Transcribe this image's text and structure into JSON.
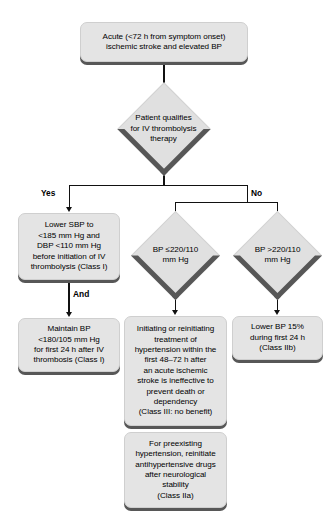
{
  "diagram": {
    "type": "flowchart",
    "colors": {
      "node_fill": "#e4e4e4",
      "diamond_fill": "#e0e0e0",
      "shadow": "#575757",
      "connector": "#111111",
      "background": "#ffffff"
    },
    "nodes": {
      "start": {
        "shape": "process",
        "text": "Acute (<72 h from symptom onset)\nischemic stroke and elevated BP"
      },
      "decision_thrombolysis": {
        "shape": "decision",
        "text": "Patient qualifies\nfor IV thrombolysis\ntherapy"
      },
      "lower_sbp": {
        "shape": "process",
        "text": "Lower SBP to\n<185 mm Hg and\nDBP <110 mm Hg\nbefore initiation of IV\nthrombolysis (Class I)"
      },
      "maintain_bp": {
        "shape": "process",
        "text": "Maintain BP\n<180/105 mm Hg\nfor first 24 h after IV\nthrombosis (Class I)"
      },
      "decision_bp_le": {
        "shape": "decision",
        "text": "BP ≤220/110\nmm Hg"
      },
      "decision_bp_gt": {
        "shape": "decision",
        "text": "BP >220/110\nmm Hg"
      },
      "ineffective": {
        "shape": "process",
        "text": "Initiating or reinitiating\ntreatment of\nhypertension within the\nfirst 48–72 h after\nan acute ischemic\nstroke is ineffective to\nprevent death or\ndependency\n(Class III: no benefit)"
      },
      "lower_bp_15": {
        "shape": "process",
        "text": "Lower BP 15%\nduring first 24 h\n(Class IIb)"
      },
      "preexisting": {
        "shape": "process",
        "text": "For preexisting\nhypertension, reinitiate\nantihypertensive drugs\nafter neurological\nstability\n(Class IIa)"
      }
    },
    "edge_labels": {
      "yes": "Yes",
      "no": "No",
      "and": "And"
    }
  }
}
